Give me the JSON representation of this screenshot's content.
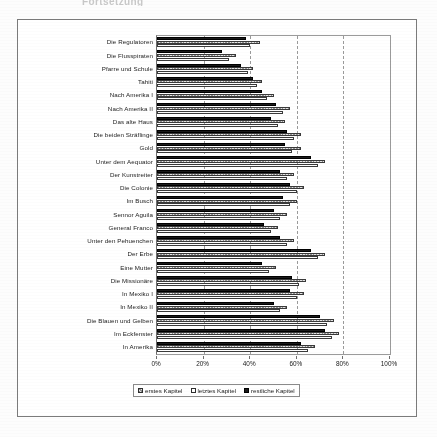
{
  "page": {
    "top_fragment": "Fortsetzung"
  },
  "chart_data": {
    "type": "bar",
    "orientation": "horizontal",
    "title": "",
    "xlabel": "",
    "ylabel": "",
    "xlim": [
      0,
      100
    ],
    "xticks": [
      "0%",
      "20%",
      "40%",
      "60%",
      "80%",
      "100%"
    ],
    "xtick_values": [
      0,
      20,
      40,
      60,
      80,
      100
    ],
    "grid": true,
    "legend_position": "bottom",
    "categories": [
      "Die Regulatoren",
      "Die Flusspiraten",
      "Pfarre und Schule",
      "Tahiti",
      "Nach Amerika I",
      "Nach Amerika II",
      "Das alte Haus",
      "Die beiden Sträflinge",
      "Gold",
      "Unter dem Aequator",
      "Der Kunstreiter",
      "Die Colonie",
      "Im Busch",
      "Sennor Aguila",
      "General Franco",
      "Unter den Pehuenchen",
      "Der Erbe",
      "Eine Mutter",
      "Die Missionäre",
      "In Mexiko I",
      "In Mexiko II",
      "Die Blauen und Gelben",
      "Im Eckfenster",
      "In Amerika"
    ],
    "series": [
      {
        "name": "erstes Kapitel",
        "values": [
          44,
          34,
          41,
          45,
          50,
          57,
          55,
          62,
          62,
          72,
          59,
          63,
          60,
          56,
          52,
          59,
          72,
          51,
          64,
          63,
          56,
          76,
          78,
          68
        ]
      },
      {
        "name": "letztes Kapitel",
        "values": [
          40,
          31,
          39,
          43,
          47,
          54,
          52,
          59,
          58,
          69,
          56,
          60,
          57,
          53,
          49,
          56,
          69,
          48,
          61,
          60,
          53,
          73,
          75,
          65
        ]
      },
      {
        "name": "restliche Kapitel",
        "values": [
          38,
          28,
          36,
          41,
          45,
          51,
          49,
          56,
          55,
          66,
          53,
          57,
          54,
          50,
          46,
          53,
          66,
          45,
          58,
          57,
          50,
          70,
          72,
          62
        ]
      }
    ]
  },
  "legend": {
    "items": [
      {
        "label": "erstes Kapitel"
      },
      {
        "label": "letztes Kapitel"
      },
      {
        "label": "restliche Kapitel"
      }
    ]
  }
}
